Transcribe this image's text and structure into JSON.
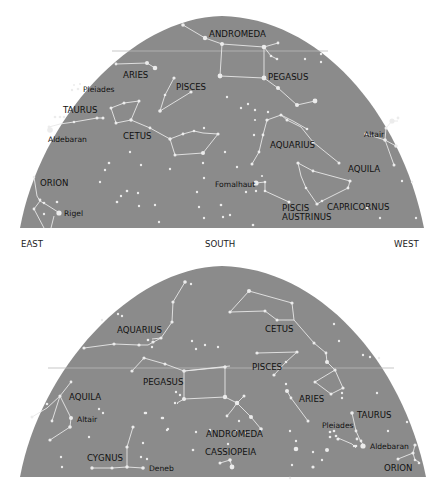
{
  "colors": {
    "sky": "#8b8b8b",
    "star": "#ececec",
    "line": "#e8e8e8",
    "label": "#111111",
    "background": "#ffffff"
  },
  "directions": {
    "east": "EAST",
    "south": "SOUTH",
    "west": "WEST"
  },
  "top_chart": {
    "constellations": {
      "andromeda": "ANDROMEDA",
      "aries": "ARIES",
      "pleiades": "Pleiades",
      "pisces": "PISCES",
      "pegasus": "PEGASUS",
      "taurus": "TAURUS",
      "aldebaran": "Aldebaran",
      "cetus": "CETUS",
      "aquarius": "AQUARIUS",
      "altair": "Altair",
      "aquila": "AQUILA",
      "orion": "ORION",
      "fomalhaut": "Fomalhaut",
      "piscis_austrinus_1": "PISCIS",
      "piscis_austrinus_2": "AUSTRINUS",
      "capricornus": "CAPRICORNUS",
      "rigel": "Rigel"
    }
  },
  "bottom_chart": {
    "constellations": {
      "aquarius": "AQUARIUS",
      "cetus": "CETUS",
      "pisces": "PISCES",
      "pegasus": "PEGASUS",
      "aries": "ARIES",
      "aquila": "AQUILA",
      "altair": "Altair",
      "taurus": "TAURUS",
      "pleiades": "Pleiades",
      "aldebaran": "Aldebaran",
      "andromeda": "ANDROMEDA",
      "cygnus": "CYGNUS",
      "cassiopeia": "CASSIOPEIA",
      "deneb": "Deneb",
      "orion": "ORION"
    }
  }
}
